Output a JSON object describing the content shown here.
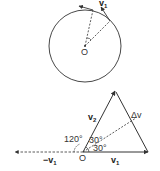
{
  "colors": {
    "stroke": "#333333",
    "background": "#ffffff"
  },
  "top_figure": {
    "center_label": "O",
    "velocity_label": "v",
    "velocity_subscript": "1"
  },
  "bottom_figure": {
    "origin_label": "O",
    "v1_label": "v",
    "v1_sub": "1",
    "neg_v1_label": "−v",
    "neg_v1_sub": "1",
    "v2_label": "v",
    "v2_sub": "2",
    "delta_v_label": "Δv",
    "angle_120": "120°",
    "angle_30a": "30°",
    "angle_30b": "30°"
  }
}
